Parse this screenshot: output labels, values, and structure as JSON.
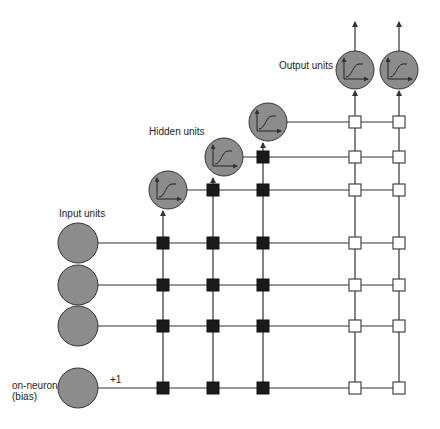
{
  "labels": {
    "input_units": "Input units",
    "hidden_units": "Hidden units",
    "output_units": "Output units",
    "bias_line1": "on-neuron",
    "bias_line2": "(bias)",
    "bias_value": "+1"
  },
  "colors": {
    "neuron_fill": "#8c8c8c",
    "neuron_stroke": "#333333",
    "line": "#333333",
    "hidden_weight": "#1a1a1a",
    "output_weight": "#ffffff"
  },
  "nodes": {
    "inputs": [
      {
        "id": "input-1",
        "cx": 78,
        "cy": 243
      },
      {
        "id": "input-2",
        "cx": 78,
        "cy": 285
      },
      {
        "id": "input-3",
        "cx": 78,
        "cy": 326
      }
    ],
    "bias": {
      "id": "bias",
      "cx": 78,
      "cy": 388
    },
    "hidden": [
      {
        "id": "hidden-1",
        "cx": 168,
        "cy": 190,
        "col_x": 163
      },
      {
        "id": "hidden-2",
        "cx": 224,
        "cy": 157,
        "col_x": 213
      },
      {
        "id": "hidden-3",
        "cx": 268,
        "cy": 122,
        "col_x": 263
      }
    ],
    "outputs": [
      {
        "id": "output-1",
        "cx": 355,
        "cy": 70,
        "col_x": 355
      },
      {
        "id": "output-2",
        "cx": 399,
        "cy": 70,
        "col_x": 399
      }
    ]
  },
  "weights": {
    "hidden_type": "filled-square",
    "output_type": "open-square"
  }
}
